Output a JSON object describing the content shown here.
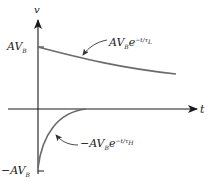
{
  "diagram": {
    "axes": {
      "y_label": "v",
      "x_label": "t"
    },
    "ticks": {
      "upper": {
        "main": "AV",
        "sub": "B"
      },
      "lower": {
        "main": "−AV",
        "sub": "B"
      }
    },
    "curves": [
      {
        "id": "low-frequency-decay",
        "label_main": "AV",
        "label_sub": "B",
        "label_base": "e",
        "label_exp": "−t/τ",
        "label_exp_sub": "L"
      },
      {
        "id": "high-frequency-decay",
        "label_main": "−AV",
        "label_sub": "B",
        "label_base": "e",
        "label_exp": "−t/τ",
        "label_exp_sub": "H"
      }
    ],
    "colors": {
      "axis": "#1a1a1a",
      "curve": "#6b6b6b",
      "text": "#222222"
    }
  }
}
